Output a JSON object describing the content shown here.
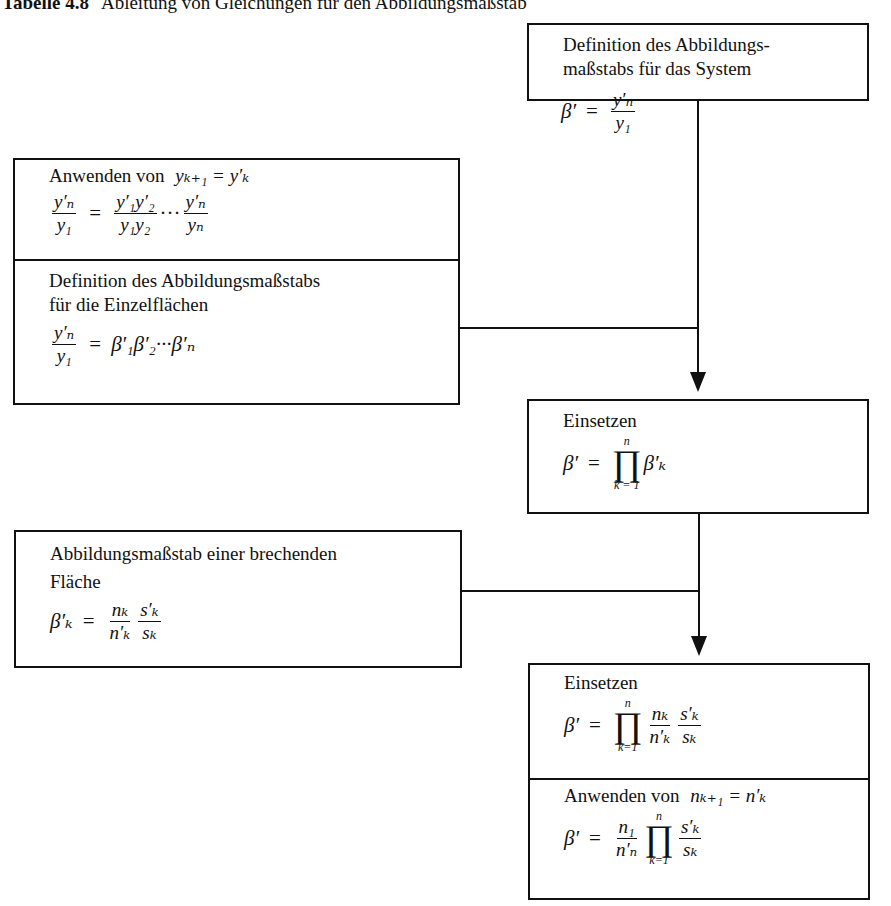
{
  "caption": {
    "number": "Tabelle 4.8",
    "title": "Ableitung von Gleichungen für den Abbildungsmaßstab"
  },
  "boxes": {
    "system_definition": {
      "text_line1": "Definition des Abbildungs-",
      "text_line2": "maßstabs für das System",
      "formula": "β′ = y′ₙ / y₁",
      "lhs": "β′",
      "eq": "=",
      "num": "y′ₙ",
      "den": "y₁"
    },
    "apply_y": {
      "label": "Anwenden von",
      "condition": "yₖ₊₁ = y′ₖ",
      "formula": "y′ₙ/y₁ = (y′₁y′₂)/(y₁y₂) ··· y′ₙ/yₙ",
      "lhs_num": "y′ₙ",
      "lhs_den": "y₁",
      "eq": "=",
      "r1_num": "y′₁y′₂",
      "r1_den": "y₁y₂",
      "dots": "···",
      "r2_num": "y′ₙ",
      "r2_den": "yₙ"
    },
    "surface_definition": {
      "text_line1": "Definition des Abbildungsmaßstabs",
      "text_line2": "für die Einzelflächen",
      "formula": "y′ₙ/y₁ = β′₁β′₂···β′ₙ",
      "lhs_num": "y′ₙ",
      "lhs_den": "y₁",
      "eq": "=",
      "rhs": "β′₁β′₂···β′ₙ"
    },
    "substitute_1": {
      "label": "Einsetzen",
      "formula": "β′ = ∏_{k=1}^{n} β′ₖ",
      "lhs": "β′",
      "eq": "=",
      "prod_upper": "n",
      "prod_symbol": "∏",
      "prod_lower": "k = 1",
      "term": "β′ₖ"
    },
    "refracting_surface": {
      "text_line1": "Abbildungsmaßstab einer brechenden",
      "text_line2": "Fläche",
      "formula": "β′ₖ = (nₖ/n′ₖ)(s′ₖ/sₖ)",
      "lhs": "β′ₖ",
      "eq": "=",
      "f1_num": "nₖ",
      "f1_den": "n′ₖ",
      "f2_num": "s′ₖ",
      "f2_den": "sₖ"
    },
    "substitute_2": {
      "label": "Einsetzen",
      "formula": "β′ = ∏_{k=1}^{n} (nₖ/n′ₖ)(s′ₖ/sₖ)",
      "lhs": "β′",
      "eq": "=",
      "prod_upper": "n",
      "prod_symbol": "∏",
      "prod_lower": "k=1",
      "f1_num": "nₖ",
      "f1_den": "n′ₖ",
      "f2_num": "s′ₖ",
      "f2_den": "sₖ"
    },
    "apply_n": {
      "label": "Anwenden von",
      "condition": "nₖ₊₁ = n′ₖ",
      "formula": "β′ = (n₁/n′ₙ) ∏_{k=1}^{n} s′ₖ/sₖ",
      "lhs": "β′",
      "eq": "=",
      "f1_num": "n₁",
      "f1_den": "n′ₙ",
      "prod_upper": "n",
      "prod_symbol": "∏",
      "prod_lower": "k=1",
      "f2_num": "s′ₖ",
      "f2_den": "sₖ"
    }
  }
}
